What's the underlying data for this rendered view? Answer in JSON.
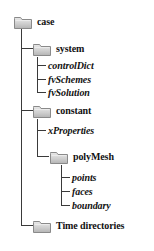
{
  "diagram": {
    "icon_name": "folder-icon",
    "line_color": "#3a3a3a",
    "text_color": "#111111",
    "background": "#ffffff",
    "nodes": [
      {
        "id": "case",
        "label": "case",
        "type": "folder",
        "depth": 0
      },
      {
        "id": "system",
        "label": "system",
        "type": "folder",
        "depth": 1
      },
      {
        "id": "controlDict",
        "label": "controlDict",
        "type": "file",
        "depth": 2
      },
      {
        "id": "fvSchemes",
        "label": "fvSchemes",
        "type": "file",
        "depth": 2
      },
      {
        "id": "fvSolution",
        "label": "fvSolution",
        "type": "file",
        "depth": 2
      },
      {
        "id": "constant",
        "label": "constant",
        "type": "folder",
        "depth": 1
      },
      {
        "id": "xProperties",
        "label": "xProperties",
        "type": "file",
        "depth": 2
      },
      {
        "id": "polyMesh",
        "label": "polyMesh",
        "type": "folder",
        "depth": 2
      },
      {
        "id": "points",
        "label": "points",
        "type": "file",
        "depth": 3
      },
      {
        "id": "faces",
        "label": "faces",
        "type": "file",
        "depth": 3
      },
      {
        "id": "boundary",
        "label": "boundary",
        "type": "file",
        "depth": 3
      },
      {
        "id": "timeDirectories",
        "label": "Time directories",
        "type": "folder",
        "depth": 1
      }
    ]
  }
}
